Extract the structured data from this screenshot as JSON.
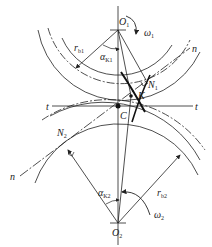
{
  "diagram": {
    "labels": {
      "O1": {
        "main": "O",
        "sub": "1"
      },
      "O2": {
        "main": "O",
        "sub": "2"
      },
      "omega1": {
        "main": "ω",
        "sub": "1"
      },
      "omega2": {
        "main": "ω",
        "sub": "2"
      },
      "rb1": {
        "main": "r",
        "sub": "b1"
      },
      "rb2": {
        "main": "r",
        "sub": "b2"
      },
      "alphaK1": {
        "main": "α",
        "sub": "K1"
      },
      "alphaK2": {
        "main": "α",
        "sub": "K2"
      },
      "N1": {
        "main": "N",
        "sub": "1"
      },
      "N2": {
        "main": "N",
        "sub": "2"
      },
      "K": "K",
      "C": "C",
      "t_left": "t",
      "t_right": "t",
      "n_top": "n",
      "n_bottom": "n"
    },
    "colors": {
      "line": "#222222",
      "background": "#ffffff"
    }
  }
}
